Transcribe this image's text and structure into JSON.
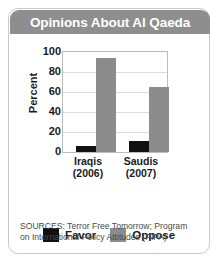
{
  "header": {
    "title": "Opinions About Al Qaeda",
    "background": "#8e8e8e",
    "text_color": "#ffffff"
  },
  "sources": {
    "line1": "SOURCES: Terror Free Tomorrow; Program",
    "line2": "on International Policy Attitudes (PIPA)"
  },
  "legend": {
    "items": [
      {
        "label": "Favor",
        "color": "#111111",
        "swatch_name": "legend-swatch-favor"
      },
      {
        "label": "Oppose",
        "color": "#8c8c8c",
        "swatch_name": "legend-swatch-oppose"
      }
    ]
  },
  "chart_data": {
    "type": "bar",
    "title": "Opinions About Al Qaeda",
    "xlabel": "",
    "ylabel": "Percent",
    "ylim": [
      0,
      100
    ],
    "yticks": [
      100,
      80,
      60,
      40,
      20,
      0
    ],
    "grid": true,
    "legend_position": "bottom",
    "categories": [
      "Iraqis (2006)",
      "Saudis (2007)"
    ],
    "category_lines": [
      [
        "Iraqis",
        "(2006)"
      ],
      [
        "Saudis",
        "(2007)"
      ]
    ],
    "series": [
      {
        "name": "Favor",
        "color": "#111111",
        "values": [
          6,
          11
        ]
      },
      {
        "name": "Oppose",
        "color": "#8c8c8c",
        "values": [
          94,
          65
        ]
      }
    ],
    "annotations": [
      "SOURCES: Terror Free Tomorrow; Program on International Policy Attitudes (PIPA)"
    ]
  }
}
